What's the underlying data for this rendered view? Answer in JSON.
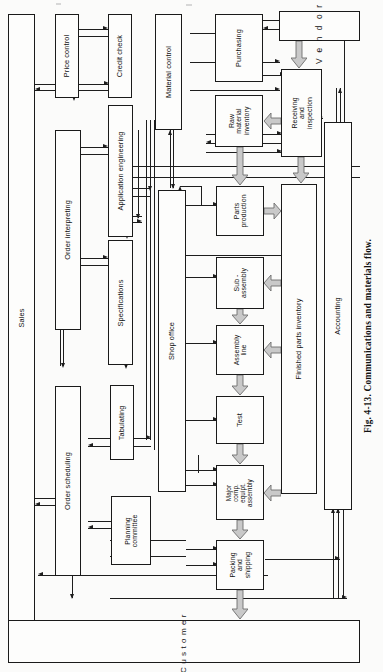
{
  "figure": {
    "caption": "Fig. 4-13.   Communications and materials flow.",
    "caption_number": "Fig. 4-13.",
    "caption_text": "Communications and materials flow."
  },
  "boxes": {
    "sales": "Sales",
    "price_control": "Price control",
    "credit_check": "Credit check",
    "order_interpreting": "Order interpreting",
    "order_scheduling": "Order scheduling",
    "application_engineering": "Application engineering",
    "specifications": "Specifications",
    "tabulating": "Tabulating",
    "planning_committee": "Planning\ncommittee",
    "material_control": "Material control",
    "shop_office": "Shop office",
    "purchasing": "Purchasing",
    "raw_material_inventory": "Raw\nmaterial\ninventory",
    "parts_production": "Parts\nproduction",
    "sub_assembly": "Sub -\nassembly",
    "assembly_line": "Assembly\nline",
    "test": "Test",
    "major_comp_equipt_assembly": "Major\ncomp.\nequipt.\nassembly",
    "packing_and_shipping": "Packing\nand\nshipping",
    "vendors": "Vendors",
    "receiving_and_inspection": "Receiving\nand\ninspection",
    "finished_parts_inventory": "Finished parts inventory",
    "accounting": "Accounting",
    "customer": "Customer"
  },
  "legend": {
    "information_flow": "thin line arrows = information flow",
    "material_flow": "wide shaded arrows = material flow"
  },
  "colors": {
    "line": "#1d1d1d",
    "box_border": "#1a1a1a",
    "box_fill": "#fdfdfc",
    "material_arrow_fill": "#c9c9c9",
    "material_arrow_stroke": "#6d6d6d",
    "page_background": "#fbfbfa"
  }
}
